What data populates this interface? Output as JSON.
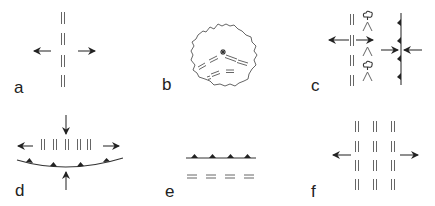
{
  "figure": {
    "panels": [
      {
        "id": "a",
        "label": "a",
        "description": "Vertical column of paired tension-gash marks with outward extension arrows"
      },
      {
        "id": "b",
        "label": "b",
        "description": "Irregular blob outline containing radiating paired dash marks from a central star symbol"
      },
      {
        "id": "c",
        "label": "c",
        "description": "Column of paired marks with wedge symbols and fault line with barbs, converging arrows"
      },
      {
        "id": "d",
        "label": "d",
        "description": "Row of paired vertical marks above curved thrust line with triangles; vertical compression arrows and horizontal extension arrows"
      },
      {
        "id": "e",
        "label": "e",
        "description": "Thrust line with triangular teeth above a row of paired horizontal marks"
      },
      {
        "id": "f",
        "label": "f",
        "description": "Grid of paired vertical marks (3 columns x 4 rows) with outward extension arrows"
      }
    ],
    "colors": {
      "line": "#666666",
      "dark": "#222222",
      "background": "#ffffff"
    }
  }
}
